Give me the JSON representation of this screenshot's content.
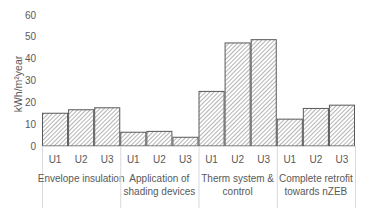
{
  "chart_data": {
    "type": "bar",
    "title": "",
    "xlabel": "",
    "ylabel": "kWh/m²year",
    "ylim": [
      0,
      60
    ],
    "yticks": [
      0,
      10,
      20,
      30,
      40,
      50,
      60
    ],
    "grid": false,
    "legend": null,
    "groups": [
      {
        "label_lines": [
          "Envelope insulation"
        ],
        "categories": [
          "U1",
          "U2",
          "U3"
        ],
        "values": [
          15,
          16.6,
          17.5
        ]
      },
      {
        "label_lines": [
          "Application of",
          "shading devices"
        ],
        "categories": [
          "U1",
          "U2",
          "U3"
        ],
        "values": [
          6.3,
          6.7,
          4.0
        ]
      },
      {
        "label_lines": [
          "Therm system &",
          "control"
        ],
        "categories": [
          "U1",
          "U2",
          "U3"
        ],
        "values": [
          25.0,
          47.2,
          48.7
        ]
      },
      {
        "label_lines": [
          "Complete retrofit",
          "towards nZEB"
        ],
        "categories": [
          "U1",
          "U2",
          "U3"
        ],
        "values": [
          12.3,
          17.2,
          18.7
        ]
      }
    ],
    "bar_style": {
      "fill": "diagonal-hatch",
      "hatch_color": "#8c8c8c",
      "edge_color": "#595959"
    }
  }
}
